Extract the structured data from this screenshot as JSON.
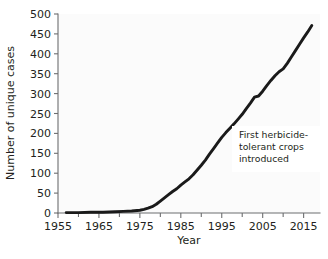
{
  "chart_data": {
    "type": "line",
    "title": "",
    "xlabel": "Year",
    "ylabel": "Number of unique cases",
    "xlim": [
      1955,
      2019
    ],
    "ylim": [
      0,
      500
    ],
    "x_ticks": [
      1955,
      1965,
      1975,
      1985,
      1995,
      2005,
      2015
    ],
    "x_minor_ticks": [
      1960,
      1970,
      1980,
      1990,
      2000,
      2010
    ],
    "y_ticks": [
      0,
      50,
      100,
      150,
      200,
      250,
      300,
      350,
      400,
      450,
      500
    ],
    "grid": false,
    "legend": "none",
    "line_color": "#1a1a1a",
    "series": [
      {
        "name": "Unique cases of herbicide resistance",
        "x": [
          1957,
          1960,
          1963,
          1966,
          1969,
          1971,
          1973,
          1975,
          1976,
          1977,
          1978,
          1979,
          1980,
          1981,
          1982,
          1983,
          1984,
          1985,
          1986,
          1987,
          1988,
          1989,
          1990,
          1991,
          1992,
          1993,
          1994,
          1995,
          1996,
          1997,
          1998,
          1999,
          2000,
          2001,
          2002,
          2003,
          2004,
          2005,
          2006,
          2007,
          2008,
          2009,
          2010,
          2011,
          2012,
          2013,
          2014,
          2015,
          2016,
          2017
        ],
        "y": [
          1,
          1,
          2,
          2,
          3,
          4,
          5,
          7,
          9,
          12,
          16,
          22,
          30,
          38,
          46,
          54,
          61,
          70,
          78,
          86,
          96,
          108,
          120,
          133,
          148,
          162,
          176,
          190,
          202,
          213,
          224,
          236,
          248,
          262,
          276,
          291,
          294,
          306,
          320,
          333,
          345,
          355,
          362,
          376,
          392,
          408,
          424,
          440,
          455,
          471
        ]
      }
    ],
    "annotations": [
      {
        "text_line1": "First herbicide-",
        "text_line2": "tolerant crops",
        "text_line3": "introduced",
        "box_fill": "#ffffff"
      }
    ]
  },
  "axis": {
    "y_tick_labels": [
      "0",
      "50",
      "100",
      "150",
      "200",
      "250",
      "300",
      "350",
      "400",
      "450",
      "500"
    ],
    "x_tick_labels": [
      "1955",
      "1965",
      "1975",
      "1985",
      "1995",
      "2005",
      "2015"
    ],
    "x_title": "Year",
    "y_title": "Number of unique cases"
  }
}
